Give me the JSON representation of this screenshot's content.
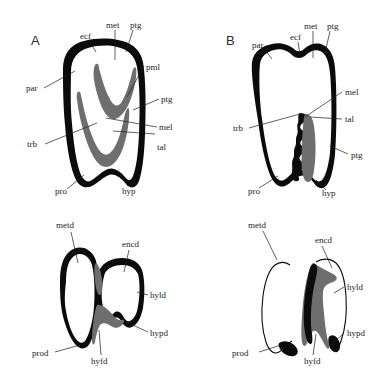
{
  "figure": {
    "background_color": "#ffffff",
    "ink_color": "#0b0b0b",
    "dentine_color": "#6f6e6f",
    "label_color": "#1c1c1c"
  },
  "panels": [
    {
      "id": "panel-a",
      "letter": "A",
      "position": "upper-left",
      "description": "upper molar occlusal outline with two chevron-shaped dentine lakes",
      "labels": [
        {
          "key": "ecf",
          "text": "ecf"
        },
        {
          "key": "met",
          "text": "met"
        },
        {
          "key": "ptg1",
          "text": "ptg"
        },
        {
          "key": "pml",
          "text": "pml"
        },
        {
          "key": "ptg2",
          "text": "ptg"
        },
        {
          "key": "mel",
          "text": "mel"
        },
        {
          "key": "tal",
          "text": "tal"
        },
        {
          "key": "par",
          "text": "par"
        },
        {
          "key": "trb",
          "text": "trb"
        },
        {
          "key": "pro",
          "text": "pro"
        },
        {
          "key": "hyp",
          "text": "hyp"
        }
      ]
    },
    {
      "id": "panel-b",
      "letter": "B",
      "position": "upper-right",
      "description": "upper molar lateral outline with crenulated enamel band and dentine strip",
      "labels": [
        {
          "key": "par",
          "text": "par"
        },
        {
          "key": "ecf",
          "text": "ecf"
        },
        {
          "key": "met",
          "text": "met"
        },
        {
          "key": "ptg1",
          "text": "ptg"
        },
        {
          "key": "mel",
          "text": "mel"
        },
        {
          "key": "tal",
          "text": "tal"
        },
        {
          "key": "ptg2",
          "text": "ptg"
        },
        {
          "key": "trb",
          "text": "trb"
        },
        {
          "key": "pro",
          "text": "pro"
        },
        {
          "key": "hyp",
          "text": "hyp"
        }
      ]
    },
    {
      "id": "panel-c",
      "letter": "",
      "position": "lower-left",
      "description": "lower molar occlusal outline with trigonid and talonid basins",
      "labels": [
        {
          "key": "metd",
          "text": "metd"
        },
        {
          "key": "encd",
          "text": "encd"
        },
        {
          "key": "hyld",
          "text": "hyld"
        },
        {
          "key": "hypd",
          "text": "hypd"
        },
        {
          "key": "hyfd",
          "text": "hyfd"
        },
        {
          "key": "prod",
          "text": "prod"
        }
      ]
    },
    {
      "id": "panel-d",
      "letter": "",
      "position": "lower-right",
      "description": "lower molar lateral outline with median dentine column",
      "labels": [
        {
          "key": "metd",
          "text": "metd"
        },
        {
          "key": "encd",
          "text": "encd"
        },
        {
          "key": "hyld",
          "text": "hyld"
        },
        {
          "key": "hypd",
          "text": "hypd"
        },
        {
          "key": "hyfd",
          "text": "hyfd"
        },
        {
          "key": "prod",
          "text": "prod"
        }
      ]
    }
  ],
  "abbreviations": {
    "ecf": "ecf",
    "met": "met",
    "ptg": "ptg",
    "pml": "pml",
    "mel": "mel",
    "tal": "tal",
    "par": "par",
    "trb": "trb",
    "pro": "pro",
    "hyp": "hyp",
    "metd": "metd",
    "encd": "encd",
    "hyld": "hyld",
    "hypd": "hypd",
    "hyfd": "hyfd",
    "prod": "prod"
  }
}
